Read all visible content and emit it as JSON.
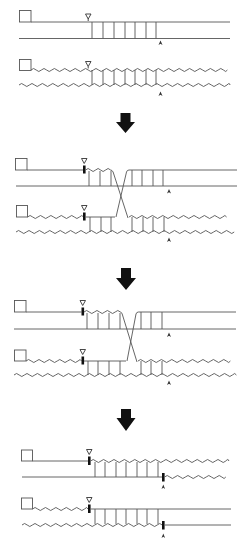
{
  "diagram": {
    "title": "",
    "colors": {
      "line": "#555555",
      "mark": "#111111",
      "background": "#ffffff"
    },
    "legend": [],
    "stages": [
      {
        "id": "stage-1",
        "label": "",
        "description": "Two aligned duplexes, paired region between site markers"
      },
      {
        "id": "stage-2",
        "label": "",
        "description": "Strand invasion forming a crossed junction"
      },
      {
        "id": "stage-3",
        "label": "",
        "description": "Junction migrated further to the right"
      },
      {
        "id": "stage-4",
        "label": "",
        "description": "Resolved recombinant duplexes with exchanged segments"
      }
    ],
    "arrows": [
      {
        "id": "arrow-1",
        "direction": "down"
      },
      {
        "id": "arrow-2",
        "direction": "down"
      },
      {
        "id": "arrow-3",
        "direction": "down"
      }
    ],
    "markers": {
      "left_site": "open-triangle-down",
      "right_site": "arrowhead-up",
      "cut": "black-bar"
    }
  }
}
